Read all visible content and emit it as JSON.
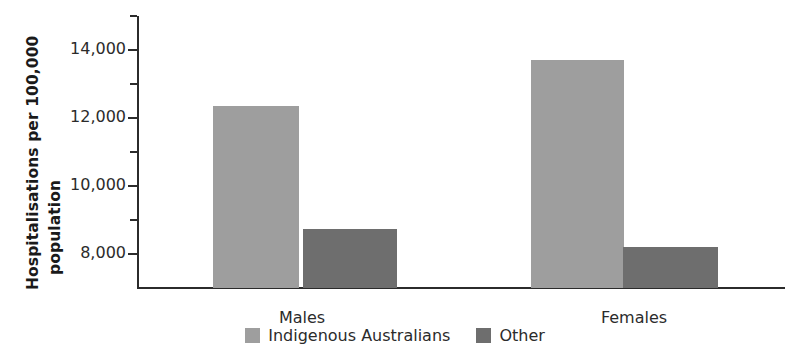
{
  "chart_data": {
    "type": "bar",
    "title": "",
    "xlabel": "",
    "ylabel_line1": "Hospitalisations per 100,000",
    "ylabel_line2": "population",
    "categories": [
      "Males",
      "Females"
    ],
    "series": [
      {
        "name": "Indigenous Australians",
        "color": "#9e9e9e",
        "values": [
          12350,
          13700
        ]
      },
      {
        "name": "Other",
        "color": "#6e6e6e",
        "values": [
          8750,
          8200
        ]
      }
    ],
    "ylim": [
      7000,
      15000
    ],
    "ytick_major_values": [
      8000,
      10000,
      12000,
      14000
    ],
    "ytick_major_labels": [
      "8,000",
      "10,000",
      "12,000",
      "14,000"
    ],
    "ytick_minor_values": [
      9000,
      11000,
      13000,
      15000
    ],
    "grid": false,
    "legend_position": "bottom-center"
  },
  "axis": {
    "ticks": [
      {
        "value": 15000,
        "label": "",
        "major": false
      },
      {
        "value": 14000,
        "label": "14,000",
        "major": true
      },
      {
        "value": 13000,
        "label": "",
        "major": false
      },
      {
        "value": 12000,
        "label": "12,000",
        "major": true
      },
      {
        "value": 11000,
        "label": "",
        "major": false
      },
      {
        "value": 10000,
        "label": "10,000",
        "major": true
      },
      {
        "value": 9000,
        "label": "",
        "major": false
      },
      {
        "value": 8000,
        "label": "8,000",
        "major": true
      }
    ]
  },
  "bars": [
    {
      "category": "Males",
      "series": "Indigenous Australians",
      "value": 12350,
      "color": "#9e9e9e"
    },
    {
      "category": "Males",
      "series": "Other",
      "value": 8750,
      "color": "#6e6e6e"
    },
    {
      "category": "Females",
      "series": "Indigenous Australians",
      "value": 13700,
      "color": "#9e9e9e"
    },
    {
      "category": "Females",
      "series": "Other",
      "value": 8200,
      "color": "#6e6e6e"
    }
  ],
  "legend": {
    "items": [
      {
        "label": "Indigenous Australians",
        "color": "#9e9e9e"
      },
      {
        "label": "Other",
        "color": "#6e6e6e"
      }
    ]
  }
}
